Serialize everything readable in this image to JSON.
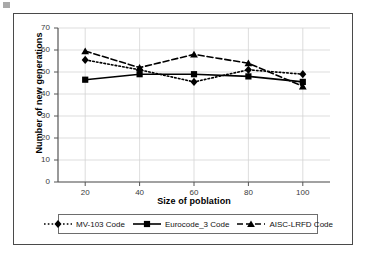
{
  "chart_data": {
    "type": "line",
    "title": "",
    "xlabel": "Size of poblation",
    "ylabel": "Number of new generations",
    "x": [
      20,
      40,
      60,
      80,
      100
    ],
    "xticklabels": [
      "20",
      "40",
      "60",
      "80",
      "100"
    ],
    "yticklabels": [
      "0",
      "10",
      "20",
      "30",
      "40",
      "50",
      "60",
      "70"
    ],
    "ylim": [
      0,
      70
    ],
    "xlim": [
      10,
      110
    ],
    "ytick_step": 10,
    "grid": "horizontal-and-vertical",
    "legend_position": "bottom",
    "series": [
      {
        "name": "MV-103 Code",
        "marker": "diamond",
        "linestyle": "dotted",
        "color": "#000000",
        "values": [
          55.5,
          51.0,
          45.5,
          51.0,
          49.0
        ]
      },
      {
        "name": "Eurocode_3 Code",
        "marker": "square",
        "linestyle": "solid",
        "color": "#000000",
        "values": [
          46.5,
          49.0,
          49.0,
          48.0,
          45.5
        ]
      },
      {
        "name": "AISC-LRFD Code",
        "marker": "triangle",
        "linestyle": "dashed",
        "color": "#000000",
        "values": [
          59.5,
          52.0,
          58.0,
          54.0,
          43.5
        ]
      }
    ]
  },
  "axis_titles": {
    "x": "Size of poblation",
    "y": "Number of new generations"
  },
  "ticks": {
    "y": [
      "70",
      "60",
      "50",
      "40",
      "30",
      "20",
      "10",
      "0"
    ],
    "x": [
      "20",
      "40",
      "60",
      "80",
      "100"
    ]
  },
  "legend": {
    "items": [
      {
        "label": "MV-103 Code",
        "marker": "diamond-marker",
        "style": "dotted"
      },
      {
        "label": "Eurocode_3 Code",
        "marker": "square-marker",
        "style": "solid"
      },
      {
        "label": "AISC-LRFD Code",
        "marker": "triangle-marker",
        "style": "dashed"
      }
    ]
  },
  "colors": {
    "series": "#000000",
    "grid": "#d4d4d4",
    "axis": "#555555",
    "frame": "#4a4a4a"
  }
}
